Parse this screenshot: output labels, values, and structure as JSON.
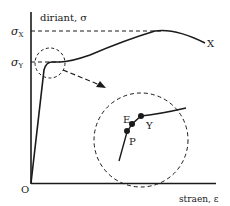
{
  "diagram": {
    "y_axis_label": "diriant, σ",
    "x_axis_label": "straen, ε",
    "origin_label": "O",
    "levels": {
      "sigma_x": {
        "symbol": "σ",
        "subscript": "X"
      },
      "sigma_y": {
        "symbol": "σ",
        "subscript": "Y"
      }
    },
    "curve_end_label": "X",
    "inset_points": [
      {
        "label": "P",
        "meaning": "proportional limit"
      },
      {
        "label": "E",
        "meaning": "elastic limit"
      },
      {
        "label": "Y",
        "meaning": "yield point"
      }
    ],
    "colors": {
      "line": "#1a1a1a",
      "background": "#ffffff"
    }
  }
}
